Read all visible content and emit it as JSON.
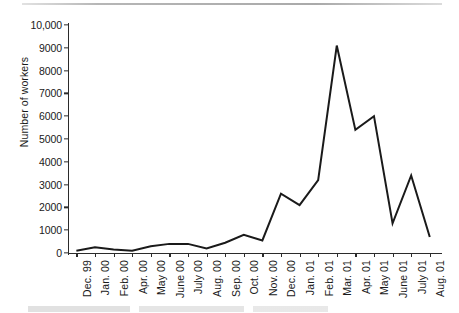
{
  "figure": {
    "ylabel": "Number of workers"
  },
  "chart_data": {
    "type": "line",
    "title": "",
    "subtitle": "",
    "xlabel": "",
    "ylabel": "Number of workers",
    "categories": [
      "Dec. 99",
      "Jan. 00",
      "Feb. 00",
      "Apr. 00",
      "May 00",
      "June 00",
      "July 00",
      "Aug. 00",
      "Sep. 00",
      "Oct. 00",
      "Nov. 00",
      "Dec. 00",
      "Jan. 01",
      "Feb. 01",
      "Mar. 01",
      "Apr. 01",
      "May 01",
      "June 01",
      "July 01",
      "Aug. 01"
    ],
    "values": [
      100,
      250,
      150,
      100,
      300,
      400,
      400,
      200,
      450,
      800,
      550,
      2600,
      2100,
      3200,
      9100,
      5400,
      6000,
      1300,
      3400,
      700
    ],
    "ylim": [
      0,
      10000
    ],
    "yticks": [
      0,
      1000,
      2000,
      3000,
      4000,
      5000,
      6000,
      7000,
      8000,
      9000,
      10000
    ],
    "ytick_labels": [
      "0",
      "1000",
      "2000",
      "3000",
      "4000",
      "5000",
      "6000",
      "7000",
      "8000",
      "9000",
      "10,000"
    ],
    "grid": false,
    "legend": "none",
    "line_color": "#1a1a1a",
    "line_width": 2
  }
}
